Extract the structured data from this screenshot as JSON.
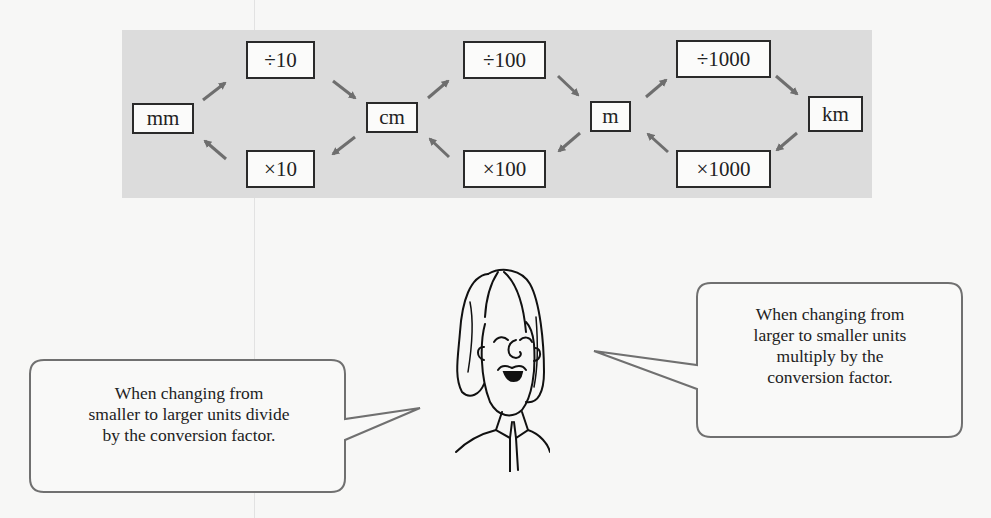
{
  "diagram": {
    "units": [
      {
        "id": "mm",
        "label": "mm"
      },
      {
        "id": "cm",
        "label": "cm"
      },
      {
        "id": "m",
        "label": "m"
      },
      {
        "id": "km",
        "label": "km"
      }
    ],
    "operations": [
      {
        "from": "mm",
        "to": "cm",
        "label": "÷10",
        "direction": "forward"
      },
      {
        "from": "cm",
        "to": "mm",
        "label": "×10",
        "direction": "backward"
      },
      {
        "from": "cm",
        "to": "m",
        "label": "÷100",
        "direction": "forward"
      },
      {
        "from": "m",
        "to": "cm",
        "label": "×100",
        "direction": "backward"
      },
      {
        "from": "m",
        "to": "km",
        "label": "÷1000",
        "direction": "forward"
      },
      {
        "from": "km",
        "to": "m",
        "label": "×1000",
        "direction": "backward"
      }
    ],
    "colors": {
      "panel": "#dcdcdc",
      "box_border": "#2a2a2a",
      "arrow": "#6e6e6e",
      "bubble_border": "#707070"
    }
  },
  "bubbles": {
    "left": {
      "lines": [
        "When changing from",
        "smaller to larger units divide",
        "by the conversion factor."
      ]
    },
    "right": {
      "lines": [
        "When changing from",
        "larger to smaller units",
        "multiply by the",
        "conversion factor."
      ]
    }
  },
  "character": {
    "description": "cartoon teacher"
  }
}
